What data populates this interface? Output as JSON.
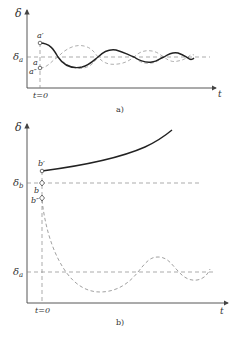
{
  "panel_a": {
    "caption": "a)",
    "y_axis_label": "δ",
    "x_axis_label": "t",
    "ref_label": "δa",
    "ref_label_main": "δ",
    "ref_label_sub": "a",
    "t0_label": "t=0",
    "points": [
      {
        "label": "a′",
        "name": "point-a-prime"
      },
      {
        "label": "a",
        "name": "point-a"
      },
      {
        "label": "a″",
        "name": "point-a-double-prime"
      }
    ]
  },
  "panel_b": {
    "caption": "b)",
    "y_axis_label": "δ",
    "x_axis_label": "t",
    "ref_label_b_main": "δ",
    "ref_label_b_sub": "b",
    "ref_label_a_main": "δ",
    "ref_label_a_sub": "a",
    "t0_label": "t=0",
    "points": [
      {
        "label": "b′",
        "name": "point-b-prime"
      },
      {
        "label": "b",
        "name": "point-b"
      },
      {
        "label": "b″",
        "name": "point-b-double-prime"
      }
    ]
  },
  "colors": {
    "solid_curve": "#222222",
    "dashed_curve": "#888888",
    "axis": "#444444",
    "text": "#333333"
  }
}
